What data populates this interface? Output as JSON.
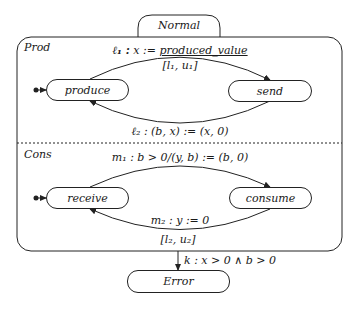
{
  "diagram": {
    "superstate": {
      "name": "Normal"
    },
    "regions": [
      {
        "name": "Prod",
        "states": [
          {
            "id": "produce",
            "label": "produce",
            "initial": true
          },
          {
            "id": "send",
            "label": "send"
          }
        ],
        "transitions": [
          {
            "from": "produce",
            "to": "send",
            "label_prefix": "ℓ₁ :",
            "label_action": "x := ",
            "label_value": "produced_value",
            "interval": "[l₁, u₁]"
          },
          {
            "from": "send",
            "to": "produce",
            "label": "ℓ₂ :  (b, x) := (x, 0)"
          }
        ]
      },
      {
        "name": "Cons",
        "states": [
          {
            "id": "receive",
            "label": "receive",
            "initial": true
          },
          {
            "id": "consume",
            "label": "consume"
          }
        ],
        "transitions": [
          {
            "from": "receive",
            "to": "consume",
            "label": "m₁ :  b > 0/(y, b) := (b, 0)"
          },
          {
            "from": "consume",
            "to": "receive",
            "label": "m₂ :  y := 0",
            "interval": "[l₂, u₂]"
          }
        ]
      }
    ],
    "exit": {
      "to": "Error",
      "label": "k :  x > 0 ∧ b > 0"
    },
    "error_state": {
      "label": "Error"
    }
  }
}
